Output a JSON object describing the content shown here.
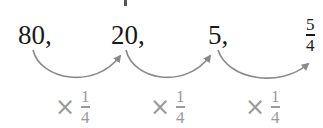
{
  "sequence": {
    "terms": [
      "80,",
      "20,",
      "5,"
    ],
    "final_term": {
      "numerator": "5",
      "denominator": "4"
    }
  },
  "operations": [
    {
      "symbol": "×",
      "numerator": "1",
      "denominator": "4"
    },
    {
      "symbol": "×",
      "numerator": "1",
      "denominator": "4"
    },
    {
      "symbol": "×",
      "numerator": "1",
      "denominator": "4"
    }
  ],
  "colors": {
    "terms": "#1a1a1a",
    "arrows": "#8a8a8a",
    "multipliers": "#9a9a9a"
  }
}
